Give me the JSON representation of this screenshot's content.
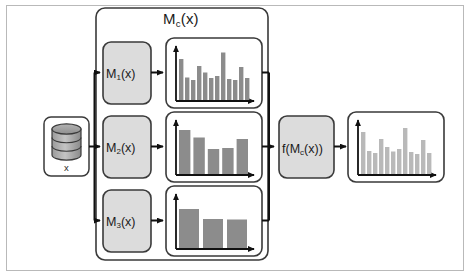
{
  "diagram": {
    "group_label_main": "M",
    "group_label_sub": "c",
    "group_label_tail": "(x)",
    "outer_border_color": "#b9b9b9",
    "box_fill": "#dcdcdc",
    "box_stroke": "#3a3a3a",
    "panel_stroke": "#3a3a3a",
    "arrow_color": "#111111",
    "bar_color_dark": "#8c8c8c",
    "bar_color_light": "#b9b9b9"
  },
  "datastore": {
    "name": "database-cylinder",
    "label": "x"
  },
  "models": [
    {
      "id": "m1",
      "main": "M",
      "sub": "1",
      "tail": "(x)",
      "label": "M1(x)"
    },
    {
      "id": "m2",
      "main": "M",
      "sub": "2",
      "tail": "(x)",
      "label": "M2(x)"
    },
    {
      "id": "m3",
      "main": "M",
      "sub": "3",
      "tail": "(x)",
      "label": "M3(x)"
    }
  ],
  "aggregator": {
    "prefix": "f(M",
    "sub": "c",
    "suffix": "(x))",
    "label": "f(Mc(x))"
  },
  "chart_data": [
    {
      "type": "bar",
      "id": "chart-m1",
      "title": "",
      "xlabel": "",
      "ylabel": "",
      "categories": [
        "1",
        "2",
        "3",
        "4",
        "5",
        "6",
        "7",
        "8",
        "9",
        "10",
        "11",
        "12"
      ],
      "values": [
        82,
        45,
        40,
        68,
        55,
        44,
        48,
        95,
        42,
        40,
        66,
        44
      ],
      "ylim": [
        0,
        100
      ],
      "grid": false,
      "legend": "none",
      "bar_color": "#8c8c8c"
    },
    {
      "type": "bar",
      "id": "chart-m2",
      "title": "",
      "xlabel": "",
      "ylabel": "",
      "categories": [
        "1",
        "2",
        "3",
        "4",
        "5"
      ],
      "values": [
        88,
        73,
        50,
        52,
        70
      ],
      "ylim": [
        0,
        100
      ],
      "grid": false,
      "legend": "none",
      "bar_color": "#8c8c8c"
    },
    {
      "type": "bar",
      "id": "chart-m3",
      "title": "",
      "xlabel": "",
      "ylabel": "",
      "categories": [
        "1",
        "2",
        "3"
      ],
      "values": [
        78,
        58,
        57
      ],
      "ylim": [
        0,
        100
      ],
      "grid": false,
      "legend": "none",
      "bar_color": "#8c8c8c"
    },
    {
      "type": "bar",
      "id": "chart-output",
      "title": "",
      "xlabel": "",
      "ylabel": "",
      "categories": [
        "1",
        "2",
        "3",
        "4",
        "5",
        "6",
        "7",
        "8",
        "9",
        "10",
        "11",
        "12"
      ],
      "values": [
        84,
        46,
        42,
        70,
        54,
        45,
        50,
        92,
        44,
        40,
        68,
        42
      ],
      "ylim": [
        0,
        100
      ],
      "grid": false,
      "legend": "none",
      "bar_color": "#b9b9b9"
    }
  ]
}
